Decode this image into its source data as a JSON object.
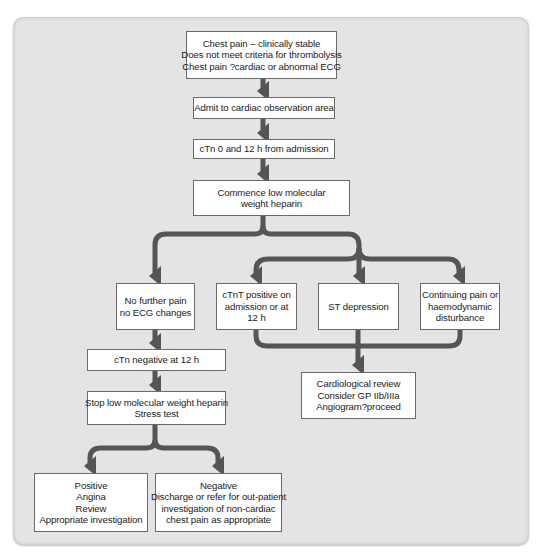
{
  "diagram": {
    "type": "flowchart",
    "colors": {
      "background": "#e4e4e4",
      "box_fill": "#ffffff",
      "box_border": "#6a6a6a",
      "connector": "#555555",
      "text": "#222222"
    },
    "nodes": {
      "start": {
        "lines": [
          "Chest pain – clinically stable",
          "Does not meet criteria for thrombolysis",
          "Chest pain ?cardiac or abnormal ECG"
        ]
      },
      "admit": {
        "lines": [
          "Admit to cardiac observation area"
        ]
      },
      "ctn_0_12": {
        "lines": [
          "cTn 0 and 12 h from admission"
        ]
      },
      "commence_lmwh": {
        "lines": [
          "Commence low molecular",
          "weight heparin"
        ]
      },
      "no_further_pain": {
        "lines": [
          "No further pain",
          "no ECG changes"
        ]
      },
      "ctnt_positive": {
        "lines": [
          "cTnT positive on",
          "admission or at",
          "12 h"
        ]
      },
      "st_depression": {
        "lines": [
          "ST depression"
        ]
      },
      "continuing_pain": {
        "lines": [
          "Continuing pain or",
          "haemodynamic",
          "disturbance"
        ]
      },
      "ctn_negative": {
        "lines": [
          "cTn negative at 12 h"
        ]
      },
      "stop_lmwh": {
        "lines": [
          "Stop low molecular weight heparin",
          "Stress test"
        ]
      },
      "cardiological_review": {
        "lines": [
          "Cardiological review",
          "Consider GP IIb/IIIa",
          "Angiogram?proceed"
        ]
      },
      "positive": {
        "lines": [
          "Positive",
          "Angina",
          "Review",
          "Appropriate investigation"
        ]
      },
      "negative": {
        "lines": [
          "Negative",
          "Discharge or refer for out-patient",
          "investigation of non-cardiac",
          "chest pain as appropriate"
        ]
      }
    },
    "edges": [
      {
        "from": "start",
        "to": "admit"
      },
      {
        "from": "admit",
        "to": "ctn_0_12"
      },
      {
        "from": "ctn_0_12",
        "to": "commence_lmwh"
      },
      {
        "from": "commence_lmwh",
        "to": "no_further_pain"
      },
      {
        "from": "commence_lmwh",
        "to": "ctnt_positive"
      },
      {
        "from": "commence_lmwh",
        "to": "st_depression"
      },
      {
        "from": "commence_lmwh",
        "to": "continuing_pain"
      },
      {
        "from": "no_further_pain",
        "to": "ctn_negative"
      },
      {
        "from": "ctn_negative",
        "to": "stop_lmwh"
      },
      {
        "from": "stop_lmwh",
        "to": "positive"
      },
      {
        "from": "stop_lmwh",
        "to": "negative"
      },
      {
        "from": "ctnt_positive",
        "to": "cardiological_review"
      },
      {
        "from": "st_depression",
        "to": "cardiological_review"
      },
      {
        "from": "continuing_pain",
        "to": "cardiological_review"
      }
    ]
  }
}
